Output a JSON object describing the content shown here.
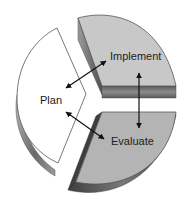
{
  "diagram": {
    "type": "cycle-pie",
    "segments": [
      {
        "id": "plan",
        "label": "Plan",
        "fill": "#ffffff"
      },
      {
        "id": "implement",
        "label": "Implement",
        "fill": "#c8c8c8"
      },
      {
        "id": "evaluate",
        "label": "Evaluate",
        "fill": "#b4b4b4"
      }
    ],
    "connections": [
      {
        "from": "Plan",
        "to": "Implement",
        "type": "bidirectional"
      },
      {
        "from": "Implement",
        "to": "Evaluate",
        "type": "bidirectional"
      },
      {
        "from": "Plan",
        "to": "Evaluate",
        "type": "bidirectional"
      }
    ],
    "colors": {
      "edge": "#555555",
      "shadow_dark": "#4a4a4a",
      "shadow_light": "#9a9a9a",
      "arrow": "#111111"
    }
  }
}
